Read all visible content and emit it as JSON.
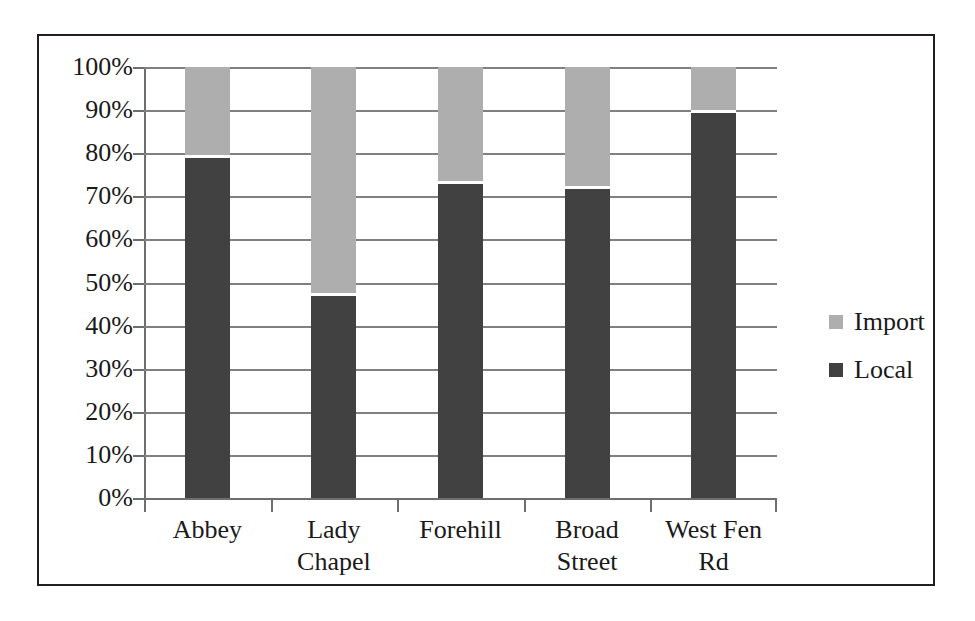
{
  "chart_data": {
    "type": "bar",
    "subtype": "stacked-100-percent",
    "title": "",
    "xlabel": "",
    "ylabel": "",
    "ylim": [
      0,
      100
    ],
    "y_tick_labels": [
      "100%",
      "90%",
      "80%",
      "70%",
      "60%",
      "50%",
      "40%",
      "30%",
      "20%",
      "10%",
      "0%"
    ],
    "y_tick_values": [
      100,
      90,
      80,
      70,
      60,
      50,
      40,
      30,
      20,
      10,
      0
    ],
    "grid": true,
    "legend_position": "right",
    "categories": [
      "Abbey",
      "Lady Chapel",
      "Forehill",
      "Broad Street",
      "West Fen Rd"
    ],
    "series": [
      {
        "name": "Import",
        "color": "#aeaeae",
        "values": [
          20.5,
          52.5,
          26.5,
          27.5,
          10.0
        ]
      },
      {
        "name": "Local",
        "color": "#414141",
        "values": [
          79.5,
          47.5,
          73.5,
          72.5,
          90.0
        ]
      }
    ]
  },
  "legend": {
    "items": [
      {
        "label": "Import",
        "color": "#aeaeae"
      },
      {
        "label": "Local",
        "color": "#414141"
      }
    ]
  },
  "colors": {
    "import": "#aeaeae",
    "local": "#414141",
    "frame": "#231f20",
    "gridline": "#808080",
    "text": "#1a1a1a",
    "background": "#ffffff"
  }
}
